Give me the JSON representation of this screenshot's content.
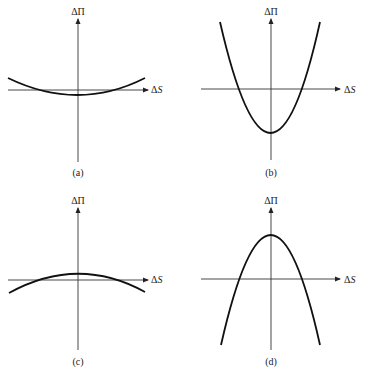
{
  "figure": {
    "y_axis_label": "ΔΠ",
    "x_axis_label_delta": "Δ",
    "x_axis_label_var": "S",
    "panels": [
      {
        "id": "a",
        "caption": "(a)",
        "shape": "shallow upward parabola, vertex slightly below x-axis"
      },
      {
        "id": "b",
        "caption": "(b)",
        "shape": "steep upward parabola, vertex well below x-axis"
      },
      {
        "id": "c",
        "caption": "(c)",
        "shape": "shallow downward parabola, vertex slightly above x-axis"
      },
      {
        "id": "d",
        "caption": "(d)",
        "shape": "steep downward parabola, vertex well above x-axis"
      }
    ]
  },
  "colors": {
    "line": "#111111",
    "axis": "#333333",
    "background": "#ffffff"
  }
}
